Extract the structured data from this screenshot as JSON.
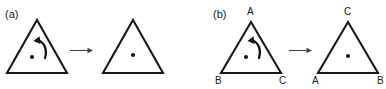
{
  "figure": {
    "background_color": "#ffffff",
    "stroke_color": "#1a1a1a",
    "panels": [
      {
        "id": "a",
        "label": "(a)",
        "shapes": [
          {
            "role": "source-triangle",
            "has_center_dot": true,
            "has_rotation_arrow": true,
            "rotation_direction": "counterclockwise",
            "vertex_labels": []
          },
          {
            "role": "result-triangle",
            "has_center_dot": true,
            "has_rotation_arrow": false,
            "vertex_labels": []
          }
        ],
        "transform_arrow": "arrow-right-icon"
      },
      {
        "id": "b",
        "label": "(b)",
        "shapes": [
          {
            "role": "source-triangle",
            "has_center_dot": true,
            "has_rotation_arrow": true,
            "rotation_direction": "counterclockwise",
            "vertex_labels": [
              "A",
              "B",
              "C"
            ],
            "vertex_label_top": "A",
            "vertex_label_bottom_left": "B",
            "vertex_label_bottom_right": "C"
          },
          {
            "role": "result-triangle",
            "has_center_dot": true,
            "has_rotation_arrow": false,
            "vertex_labels": [
              "C",
              "A",
              "B"
            ],
            "vertex_label_top": "C",
            "vertex_label_bottom_left": "A",
            "vertex_label_bottom_right": "B"
          }
        ],
        "transform_arrow": "arrow-right-icon"
      }
    ]
  }
}
